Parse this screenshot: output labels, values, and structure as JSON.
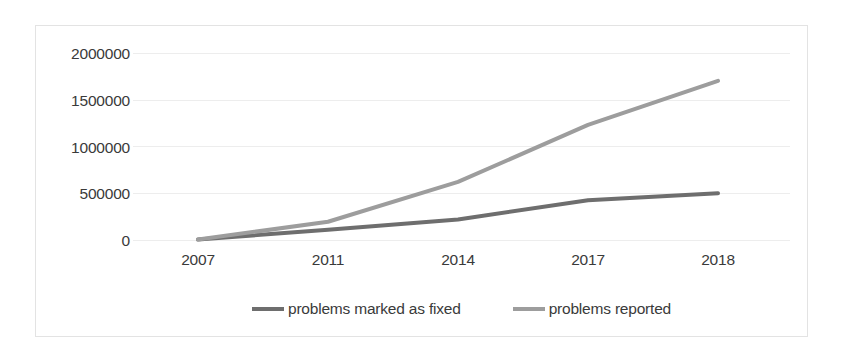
{
  "chart_data": {
    "type": "line",
    "title": "",
    "subtitle": "",
    "xlabel": "",
    "ylabel": "",
    "categories": [
      "2007",
      "2011",
      "2014",
      "2017",
      "2018"
    ],
    "x_tick_labels": [
      "2007",
      "2011",
      "2014",
      "2017",
      "2018"
    ],
    "y_tick_labels": [
      "2000000",
      "1500000",
      "1000000",
      "500000",
      "0"
    ],
    "y_tick_values": [
      2000000,
      1500000,
      1000000,
      500000,
      0
    ],
    "ylim": [
      0,
      2000000
    ],
    "grid": true,
    "grid_axis": "y",
    "legend_position": "bottom",
    "series": [
      {
        "name": "problems marked as fixed",
        "color": "#6e6e6e",
        "values": [
          5000,
          110000,
          220000,
          425000,
          500000
        ]
      },
      {
        "name": "problems reported",
        "color": "#9d9d9d",
        "values": [
          5000,
          195000,
          620000,
          1230000,
          1700000
        ]
      }
    ],
    "annotations": []
  },
  "legend": {
    "entries": [
      {
        "label": "problems marked as fixed",
        "color": "#6e6e6e"
      },
      {
        "label": "problems reported",
        "color": "#9d9d9d"
      }
    ]
  },
  "colors": {
    "series_fixed": "#6e6e6e",
    "series_reported": "#9d9d9d",
    "gridline": "#ededed",
    "frame": "#e3e3e3",
    "text": "#3a3a3a",
    "background": "#ffffff"
  }
}
